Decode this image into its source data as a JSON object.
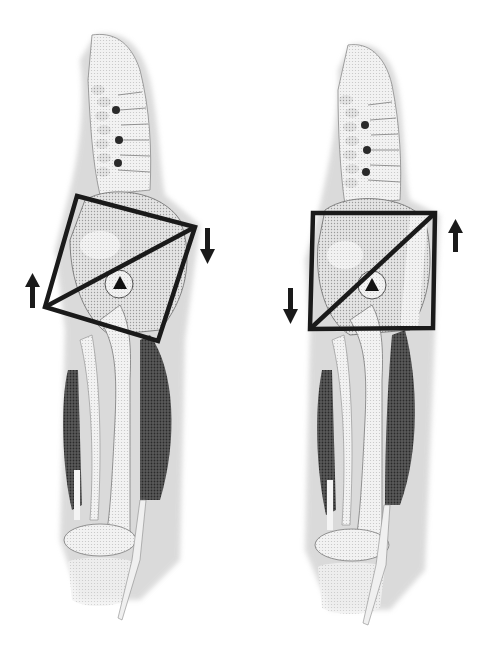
{
  "figure": {
    "background": "#ffffff",
    "line_color": "#1a1a1a",
    "panels": [
      {
        "id": "left",
        "tilt": "rotated square (pelvis tilted)",
        "square": [
          [
            77,
            196
          ],
          [
            195,
            227
          ],
          [
            158,
            341
          ],
          [
            45,
            307
          ]
        ],
        "diagonal": [
          [
            45,
            307
          ],
          [
            195,
            227
          ]
        ],
        "hip_triangle": [
          120,
          283
        ],
        "arrows": [
          {
            "direction": "up",
            "x": 32,
            "y": 292
          },
          {
            "direction": "down",
            "x": 208,
            "y": 247
          }
        ]
      },
      {
        "id": "right",
        "tilt": "upright square (neutral pelvis)",
        "square": [
          [
            313,
            213
          ],
          [
            435,
            213
          ],
          [
            433,
            328
          ],
          [
            310,
            329
          ]
        ],
        "diagonal": [
          [
            310,
            329
          ],
          [
            435,
            213
          ]
        ],
        "hip_triangle": [
          372,
          285
        ],
        "arrows": [
          {
            "direction": "down",
            "x": 291,
            "y": 305
          },
          {
            "direction": "up",
            "x": 456,
            "y": 237
          }
        ]
      }
    ]
  }
}
